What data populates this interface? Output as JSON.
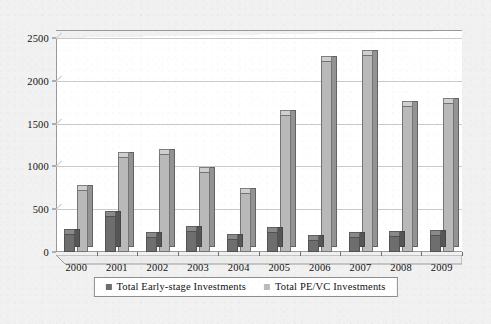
{
  "chart_data": {
    "type": "bar",
    "title": "",
    "subtitle": "",
    "xlabel": "",
    "ylabel": "",
    "grid": true,
    "legend_position": "bottom",
    "ylim": [
      0,
      2500
    ],
    "yticks": [
      0,
      500,
      1000,
      1500,
      2000,
      2500
    ],
    "ytick_labels": [
      "0",
      "500",
      "1000",
      "1500",
      "2000",
      "2500"
    ],
    "categories": [
      "2000",
      "2001",
      "2002",
      "2003",
      "2004",
      "2005",
      "2006",
      "2007",
      "2008",
      "2009"
    ],
    "series": [
      {
        "name": "Total Early-stage Investments",
        "color": "#6e6e6e",
        "values": [
          215,
          420,
          170,
          240,
          150,
          230,
          140,
          175,
          185,
          195
        ]
      },
      {
        "name": "Total PE/VC Investments",
        "color": "#b9b9b9",
        "values": [
          730,
          1110,
          1140,
          930,
          690,
          1600,
          2230,
          2300,
          1705,
          1745
        ]
      }
    ]
  },
  "legend": {
    "items": [
      {
        "label": "Total Early-stage Investments",
        "swatch": "dark"
      },
      {
        "label": "Total PE/VC Investments",
        "swatch": "light"
      }
    ]
  }
}
